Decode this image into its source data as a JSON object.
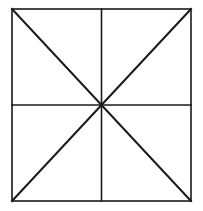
{
  "figure": {
    "background_color": "#ffffff",
    "canvas": {
      "width": 203,
      "height": 211
    },
    "stroke_color": "#1a1a1a",
    "border_stroke_width": 1.6,
    "midline_stroke_width": 1.6,
    "diagonal_stroke_width": 2.0,
    "square": {
      "left": 12,
      "top": 9,
      "right": 191,
      "bottom": 201,
      "width": 179,
      "height": 192
    },
    "center_point": {
      "x": 101.5,
      "y": 105
    },
    "shapes": [
      {
        "name": "outer-square",
        "type": "rect",
        "x": 12,
        "y": 9,
        "width": 179,
        "height": 192
      },
      {
        "name": "vertical-midline",
        "type": "line",
        "x1": 101.5,
        "y1": 9,
        "x2": 101.5,
        "y2": 201
      },
      {
        "name": "horizontal-midline",
        "type": "line",
        "x1": 12,
        "y1": 105,
        "x2": 191,
        "y2": 105
      },
      {
        "name": "diagonal-top-left-to-bottom-right",
        "type": "line",
        "x1": 12,
        "y1": 9,
        "x2": 191,
        "y2": 201
      },
      {
        "name": "diagonal-top-right-to-bottom-left",
        "type": "line",
        "x1": 191,
        "y1": 9,
        "x2": 12,
        "y2": 201
      }
    ]
  }
}
